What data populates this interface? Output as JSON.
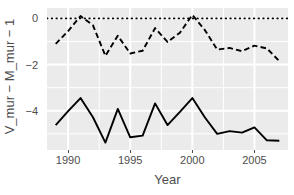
{
  "chart_data": {
    "type": "line",
    "title": "",
    "subtitle": "",
    "xlabel": "Year",
    "ylabel": "V_mur − M_mur − 1",
    "xlim": [
      1988.3,
      1207.0
    ],
    "x_range": [
      1988.3,
      2007.7
    ],
    "ylim": [
      -5.7,
      0.45
    ],
    "grid": true,
    "legend": "none",
    "x_ticks": [
      1990,
      1995,
      2000,
      2005
    ],
    "x_tick_labels": [
      "1990",
      "1995",
      "2000",
      "2005"
    ],
    "y_ticks": [
      0,
      -2,
      -4
    ],
    "y_tick_labels": [
      "0",
      "−2",
      "−4"
    ],
    "y_minor_ticks": [
      -1,
      -3,
      -5
    ],
    "x_minor_ticks": [
      1992.5,
      1997.5,
      2002.5
    ],
    "panel_background": "#EBEBEB",
    "grid_color": "#FFFFFF",
    "axis_text_color": "#4D4D4D",
    "reference_line": {
      "name": "zero-line",
      "y": 0,
      "style": "dotted",
      "color": "#000000"
    },
    "x": [
      1989,
      1990,
      1991,
      1992,
      1993,
      1994,
      1995,
      1996,
      1997,
      1998,
      1999,
      2000,
      2001,
      2002,
      2003,
      2004,
      2005,
      2006,
      2007
    ],
    "series": [
      {
        "name": "dashed-series",
        "style": "dashed",
        "color": "#000000",
        "values": [
          -1.1,
          -0.55,
          0.1,
          -0.3,
          -1.62,
          -0.75,
          -1.52,
          -1.4,
          -0.42,
          -1.02,
          -0.62,
          0.15,
          -0.5,
          -1.35,
          -1.28,
          -1.42,
          -1.18,
          -1.3,
          -1.85
        ]
      },
      {
        "name": "solid-series",
        "style": "solid",
        "color": "#000000",
        "values": [
          -4.62,
          -4.02,
          -3.45,
          -4.28,
          -5.38,
          -3.92,
          -5.15,
          -5.08,
          -3.68,
          -4.62,
          -4.05,
          -3.45,
          -4.28,
          -5.0,
          -4.88,
          -4.95,
          -4.72,
          -5.28,
          -5.3
        ]
      }
    ]
  }
}
